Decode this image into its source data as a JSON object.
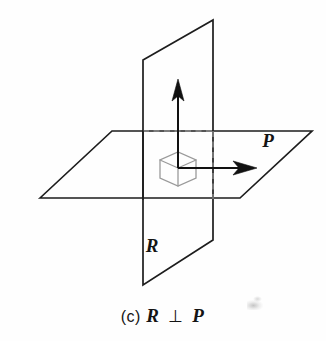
{
  "figure": {
    "caption_prefix": "(c)",
    "caption_first_symbol": "R",
    "caption_relation": "⊥",
    "caption_second_symbol": "P",
    "caption_full": "(c) R ⊥ P",
    "labels": {
      "horizontal_plane": "P",
      "vertical_plane": "R"
    },
    "colors": {
      "stroke": "#1d1d1d",
      "hidden_stroke": "#8b8b8b",
      "angle_marker": "#9a9a9a",
      "background": "#fefefe",
      "vector": "#111111"
    },
    "geometry": {
      "description": "Two perpendicular planes R and P intersecting along a line, with normal vectors shown at the intersection point and a cube-corner right-angle marker",
      "horizontal_plane_P": {
        "name": "P",
        "points": "40,198 112,131 312,131 240,198"
      },
      "vertical_plane_R_visible": {
        "name": "R",
        "points": "143,60 213,20 213,240 143,285"
      },
      "hidden_edges": [
        "143,131 213,131",
        "213,131 213,198"
      ],
      "origin": {
        "x": 178,
        "y": 168
      },
      "vertical_vector": {
        "from_x": 178,
        "from_y": 168,
        "to_x": 178,
        "to_y": 83
      },
      "horizontal_vector": {
        "from_x": 178,
        "from_y": 168,
        "to_x": 255,
        "to_y": 168
      },
      "angle_marker_points": "160,160 160,178 178,186 196,178 196,160 178,152"
    }
  }
}
